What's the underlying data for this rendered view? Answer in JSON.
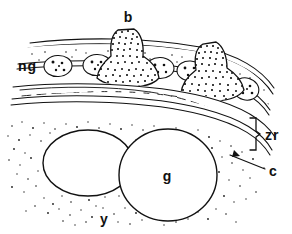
{
  "figure": {
    "type": "histological-line-drawing",
    "background_color": "#ffffff",
    "ink_color": "#111111"
  },
  "labels": {
    "b": {
      "text": "b",
      "x": 128,
      "y": 22,
      "meaning": "bell-shaped dark body"
    },
    "ng": {
      "text": "ng",
      "x": 18,
      "y": 67,
      "meaning": "nurse cells"
    },
    "zr": {
      "text": "zr",
      "x": 266,
      "y": 136,
      "meaning": "zona radiata"
    },
    "c": {
      "text": "c",
      "x": 272,
      "y": 173,
      "meaning": "chorion"
    },
    "g": {
      "text": "g",
      "x": 167,
      "y": 177,
      "meaning": "germ cell / oocyte"
    },
    "y": {
      "text": "y",
      "x": 104,
      "y": 221,
      "meaning": "yolk"
    }
  },
  "structures": {
    "bell_bodies": [
      {
        "name": "b-body-left",
        "cx": 127,
        "cy": 58,
        "rotation": 0
      },
      {
        "name": "b-body-right",
        "cx": 207,
        "cy": 72,
        "rotation": 12
      }
    ],
    "nurse_cells": [
      {
        "cx": 58,
        "cy": 66,
        "rx": 14,
        "ry": 10,
        "rot": -3,
        "dots": 5
      },
      {
        "cx": 97,
        "cy": 65,
        "rx": 14,
        "ry": 10,
        "rot": -3,
        "dots": 5
      },
      {
        "cx": 160,
        "cy": 68,
        "rx": 14,
        "ry": 10,
        "rot": 2,
        "dots": 4
      },
      {
        "cx": 190,
        "cy": 70,
        "rx": 13,
        "ry": 10,
        "rot": 4,
        "dots": 4
      },
      {
        "cx": 245,
        "cy": 88,
        "rx": 13,
        "ry": 11,
        "rot": 14,
        "dots": 5
      }
    ],
    "oocytes": [
      {
        "name": "oocyte-left",
        "cx": 88,
        "cy": 163,
        "rx": 45,
        "ry": 33,
        "labeled": false
      },
      {
        "name": "oocyte-right",
        "cx": 168,
        "cy": 175,
        "rx": 49,
        "ry": 46,
        "labeled": true
      }
    ],
    "brace": {
      "name": "zona-radiata-brace",
      "x": 255,
      "y_top": 118,
      "y_bottom": 152
    },
    "leader_line": {
      "name": "chorion-leader",
      "x1": 232,
      "y1": 157,
      "x2": 266,
      "y2": 170
    }
  }
}
